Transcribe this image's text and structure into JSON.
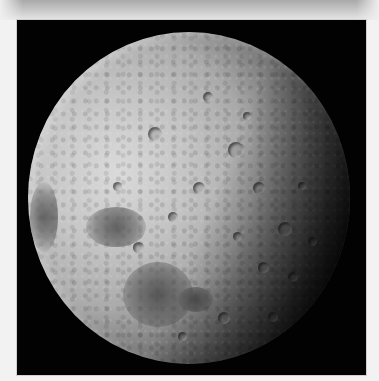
{
  "image": {
    "subject": "Moon",
    "description": "Grayscale photograph of the Moon showing cratered surface with dark maria on the lower-left and a shadowed terminator on the right",
    "colors": {
      "page_background": "#f2f2f2",
      "top_band": "#b8b8b8",
      "photo_background": "#020202",
      "moon_highlight": "#d8d8d8",
      "moon_shadow": "#050505"
    }
  },
  "moon_features": {
    "maria": [
      {
        "name": "upper-left-mare",
        "x": 58,
        "y": 175,
        "w": 60,
        "h": 40
      },
      {
        "name": "lower-center-mare",
        "x": 95,
        "y": 230,
        "w": 70,
        "h": 65
      },
      {
        "name": "left-limb-mare",
        "x": 2,
        "y": 150,
        "w": 28,
        "h": 70
      },
      {
        "name": "small-mare",
        "x": 150,
        "y": 255,
        "w": 35,
        "h": 25
      }
    ],
    "craters": [
      {
        "x": 120,
        "y": 95,
        "d": 14
      },
      {
        "x": 175,
        "y": 60,
        "d": 10
      },
      {
        "x": 200,
        "y": 110,
        "d": 16
      },
      {
        "x": 225,
        "y": 150,
        "d": 12
      },
      {
        "x": 250,
        "y": 190,
        "d": 14
      },
      {
        "x": 230,
        "y": 230,
        "d": 11
      },
      {
        "x": 260,
        "y": 240,
        "d": 10
      },
      {
        "x": 205,
        "y": 200,
        "d": 9
      },
      {
        "x": 165,
        "y": 150,
        "d": 12
      },
      {
        "x": 140,
        "y": 180,
        "d": 10
      },
      {
        "x": 85,
        "y": 150,
        "d": 9
      },
      {
        "x": 105,
        "y": 210,
        "d": 11
      },
      {
        "x": 190,
        "y": 280,
        "d": 12
      },
      {
        "x": 240,
        "y": 280,
        "d": 10
      },
      {
        "x": 270,
        "y": 150,
        "d": 8
      },
      {
        "x": 150,
        "y": 300,
        "d": 9
      },
      {
        "x": 215,
        "y": 80,
        "d": 8
      },
      {
        "x": 280,
        "y": 205,
        "d": 9
      }
    ]
  }
}
